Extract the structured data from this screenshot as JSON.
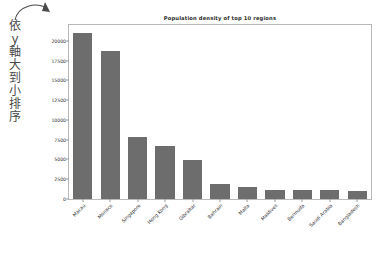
{
  "annotation": {
    "text_lines": [
      "依",
      "y",
      "軸",
      "大",
      "到",
      "小",
      "排",
      "序"
    ],
    "full_text": "依 y 軸大到小排序",
    "arrow_name": "curved-arrow-annotation",
    "color": "#4a4a4a"
  },
  "chart_data": {
    "type": "bar",
    "title": "Population density of top 10 regions",
    "xlabel": "",
    "ylabel": "",
    "categories": [
      "Macau",
      "Monaco",
      "Singapore",
      "Hong Kong",
      "Gibraltar",
      "Bahrain",
      "Malta",
      "Maldives",
      "Bermuda",
      "Saudi Arabia",
      "Bangladesh"
    ],
    "values": [
      21000,
      18700,
      7800,
      6700,
      4900,
      1850,
      1500,
      1150,
      1120,
      1100,
      1050
    ],
    "ylim": [
      0,
      22000
    ],
    "yticks": [
      0,
      2500,
      5000,
      7500,
      10000,
      12500,
      15000,
      17500,
      20000
    ],
    "ytick_labels": [
      "0",
      "2500",
      "5000",
      "7500",
      "10000",
      "12500",
      "15000",
      "17500",
      "20000"
    ],
    "grid": false,
    "legend": null,
    "bar_color": "#6d6d6d",
    "frame_color": "#b9b9b9",
    "xtick_rotation": -45
  }
}
